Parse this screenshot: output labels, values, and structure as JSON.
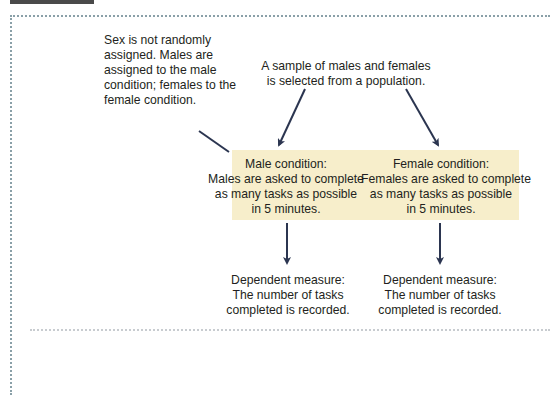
{
  "figure": {
    "note_left": {
      "lines": [
        "Sex is not randomly",
        "assigned. Males are",
        "assigned to the male",
        "condition; females to the",
        "female condition."
      ]
    },
    "sample_note": {
      "lines": [
        "A sample of males and females",
        "is selected from a population."
      ]
    },
    "conditions": [
      {
        "lines": [
          "Male condition:",
          "Males are asked to complete",
          "as many tasks as possible",
          "in 5 minutes."
        ]
      },
      {
        "lines": [
          "Female condition:",
          "Females are asked to complete",
          "as many tasks as possible",
          "in 5 minutes."
        ]
      }
    ],
    "dependent_measures": [
      {
        "lines": [
          "Dependent measure:",
          "The number of tasks",
          "completed is recorded."
        ]
      },
      {
        "lines": [
          "Dependent measure:",
          "The number of tasks",
          "completed is recorded."
        ]
      }
    ],
    "colors": {
      "condition_box": "#f7eecb",
      "arrow": "#2b3550",
      "text": "#231f20",
      "frame_dots": "#8aa0a8",
      "top_tab": "#4a4a4a"
    }
  }
}
